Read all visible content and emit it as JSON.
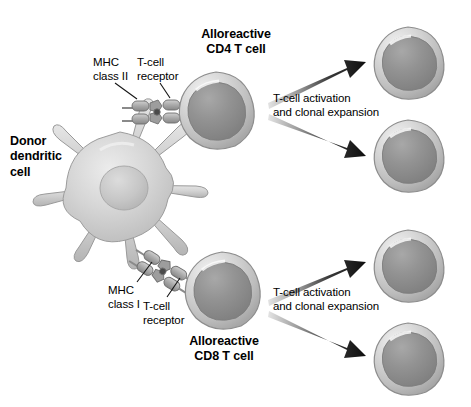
{
  "figure": {
    "background_color": "#ffffff",
    "width": 471,
    "height": 407
  },
  "palette": {
    "cell_outline": "#8f8f8f",
    "cell_cytoplasm_light": "#d8d8d8",
    "cell_cytoplasm_mid": "#bdbdbd",
    "nucleus_dark": "#8c8c8c",
    "nucleus_mid": "#9a9a9a",
    "dendritic_body": "#d2d2d2",
    "dendritic_nucleus": "#c2c2c2",
    "receptor_block": "#a8a8a8",
    "arrow_dark": "#111111",
    "arrow_light": "#d5d5d5",
    "leader_line": "#1a1a1a",
    "text": "#000000"
  },
  "labels": {
    "donor_dendritic_cell": "Donor\ndendritic\ncell",
    "mhc_class_ii": "MHC\nclass II",
    "t_cell_receptor_top": "T-cell\nreceptor",
    "alloreactive_cd4": "Alloreactive\nCD4 T cell",
    "activation_top": "T-cell activation\nand clonal expansion",
    "mhc_class_i": "MHC\nclass I",
    "t_cell_receptor_bottom": "T-cell\nreceptor",
    "alloreactive_cd8": "Alloreactive\nCD8 T cell",
    "activation_bottom": "T-cell activation\nand clonal expansion"
  },
  "cells": {
    "dendritic": {
      "name": "donor-dendritic-cell",
      "cx": 120,
      "cy": 185,
      "arms": 8
    },
    "cd4_t_cell": {
      "name": "alloreactive-cd4-t-cell",
      "cx": 216,
      "cy": 110,
      "r": 38
    },
    "cd8_t_cell": {
      "name": "alloreactive-cd8-t-cell",
      "cx": 222,
      "cy": 290,
      "r": 38
    },
    "daughters": [
      {
        "name": "cd4-daughter-cell-1",
        "cx": 408,
        "cy": 62,
        "r": 35
      },
      {
        "name": "cd4-daughter-cell-2",
        "cx": 408,
        "cy": 155,
        "r": 35
      },
      {
        "name": "cd8-daughter-cell-1",
        "cx": 408,
        "cy": 265,
        "r": 35
      },
      {
        "name": "cd8-daughter-cell-2",
        "cx": 408,
        "cy": 358,
        "r": 35
      }
    ]
  },
  "arrows": [
    {
      "name": "arrow-cd4-expansion-1",
      "from": [
        268,
        100
      ],
      "to": [
        364,
        62
      ]
    },
    {
      "name": "arrow-cd4-expansion-2",
      "from": [
        268,
        120
      ],
      "to": [
        364,
        156
      ]
    },
    {
      "name": "arrow-cd8-expansion-1",
      "from": [
        268,
        296
      ],
      "to": [
        364,
        262
      ]
    },
    {
      "name": "arrow-cd8-expansion-2",
      "from": [
        268,
        316
      ],
      "to": [
        364,
        356
      ]
    }
  ],
  "receptor_complexes": [
    {
      "name": "mhc-class-ii-tcr-complex",
      "angle_deg": 0,
      "x": 126,
      "y": 112
    },
    {
      "name": "mhc-class-i-tcr-complex",
      "angle_deg": 32,
      "x": 140,
      "y": 276
    }
  ]
}
